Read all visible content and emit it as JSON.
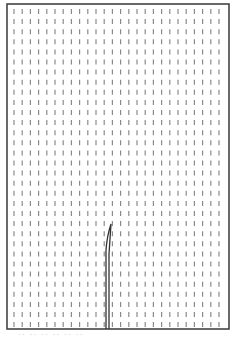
{
  "figure": {
    "frame": {
      "x": 7,
      "y": 4,
      "width": 222,
      "height": 325,
      "stroke": "#444444"
    },
    "grid": {
      "start_x": 14,
      "start_y": 9,
      "dx": 8.2,
      "dy": 10.1,
      "columns": 26,
      "rows": 32,
      "dash_length": 5,
      "dash_color": "#8a8a8a"
    },
    "crack": {
      "color": "#333333",
      "tip": [
        111,
        224
      ],
      "bend": [
        106,
        250
      ],
      "base_left_x": 106,
      "base_right_x": 109,
      "base_y": 329
    },
    "caption": "·· ·· ·· ·· ·· ··"
  }
}
